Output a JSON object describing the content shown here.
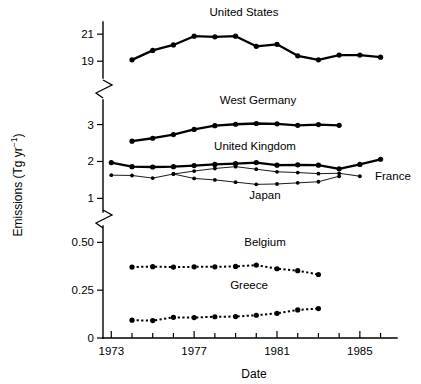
{
  "chart_data": {
    "type": "line",
    "title": "",
    "xlabel": "Date",
    "ylabel": "Emissions (Tg yr−1)",
    "ylabel_plain": "Emissions (Tg yr-1)",
    "x": [
      1974,
      1975,
      1976,
      1977,
      1978,
      1979,
      1980,
      1981,
      1982,
      1983,
      1984,
      1985,
      1986
    ],
    "xlim": [
      1972.6,
      1986.6
    ],
    "xticks_major": [
      1973,
      1977,
      1981,
      1985
    ],
    "xtick_labels": [
      "1973",
      "1977",
      "1981",
      "1985"
    ],
    "xticks_minor": [
      1974,
      1975,
      1976,
      1978,
      1979,
      1980,
      1982,
      1983,
      1984,
      1986
    ],
    "grid": false,
    "legend": "inline-labels",
    "broken_axis": true,
    "panels": [
      {
        "name": "top-panel",
        "ylim": [
          18.2,
          21.9
        ],
        "yticks": [
          19,
          21
        ],
        "ytick_labels": [
          "19",
          "21"
        ]
      },
      {
        "name": "middle-panel",
        "ylim": [
          0.82,
          3.45
        ],
        "yticks": [
          1,
          2,
          3
        ],
        "ytick_labels": [
          "1",
          "2",
          "3"
        ]
      },
      {
        "name": "bottom-panel",
        "ylim": [
          0,
          0.575
        ],
        "yticks": [
          0,
          0.25,
          0.5
        ],
        "ytick_labels": [
          "0",
          "0.25",
          "0.50"
        ]
      }
    ],
    "series": [
      {
        "name": "United States",
        "panel": "top-panel",
        "style": "solid-thick",
        "marker": "filled-circle-large",
        "label_x": 1979.0,
        "x": [
          1974,
          1975,
          1976,
          1977,
          1978,
          1979,
          1980,
          1981,
          1982,
          1983,
          1984,
          1985,
          1986
        ],
        "values": [
          19.1,
          19.8,
          20.2,
          20.85,
          20.8,
          20.85,
          20.1,
          20.25,
          19.4,
          19.1,
          19.45,
          19.45,
          19.3
        ]
      },
      {
        "name": "West Germany",
        "panel": "middle-panel",
        "style": "solid-thick",
        "marker": "filled-circle-large",
        "label_x": 1978.7,
        "x": [
          1974,
          1975,
          1976,
          1977,
          1978,
          1979,
          1980,
          1981,
          1982,
          1983,
          1984
        ],
        "values": [
          2.55,
          2.63,
          2.73,
          2.87,
          2.97,
          3.01,
          3.03,
          3.02,
          2.98,
          3.0,
          2.98
        ]
      },
      {
        "name": "United Kingdom",
        "panel": "middle-panel",
        "style": "solid-thick",
        "marker": "filled-circle-large",
        "label_x": 1979.1,
        "x": [
          1973,
          1974,
          1975,
          1976,
          1977,
          1978,
          1979,
          1980,
          1981,
          1982,
          1983,
          1984,
          1985,
          1986
        ],
        "values": [
          1.97,
          1.86,
          1.85,
          1.86,
          1.89,
          1.92,
          1.94,
          1.97,
          1.9,
          1.91,
          1.9,
          1.8,
          1.92,
          2.06
        ]
      },
      {
        "name": "France",
        "panel": "middle-panel",
        "style": "solid-thin",
        "marker": "filled-circle-small",
        "label_x": 1986.7,
        "x": [
          1973,
          1974,
          1975,
          1976,
          1977,
          1978,
          1979,
          1980,
          1981,
          1982,
          1983,
          1984,
          1985
        ],
        "values": [
          1.63,
          1.62,
          1.55,
          1.66,
          1.74,
          1.81,
          1.86,
          1.79,
          1.72,
          1.7,
          1.67,
          1.68,
          1.6
        ]
      },
      {
        "name": "Japan",
        "panel": "middle-panel",
        "style": "solid-thin",
        "marker": "filled-circle-small",
        "label_x": 1979.6,
        "x": [
          1976,
          1977,
          1978,
          1979,
          1980,
          1981,
          1982,
          1983,
          1984
        ],
        "values": [
          1.66,
          1.54,
          1.5,
          1.44,
          1.38,
          1.39,
          1.42,
          1.45,
          1.6
        ]
      },
      {
        "name": "Belgium",
        "panel": "bottom-panel",
        "style": "dashed",
        "marker": "filled-circle-large",
        "label_x": 1979.3,
        "x": [
          1974,
          1975,
          1976,
          1977,
          1978,
          1979,
          1980,
          1981,
          1982,
          1983
        ],
        "values": [
          0.371,
          0.373,
          0.371,
          0.372,
          0.372,
          0.374,
          0.381,
          0.362,
          0.352,
          0.332
        ]
      },
      {
        "name": "Greece",
        "panel": "bottom-panel",
        "style": "dashed",
        "marker": "filled-circle-large",
        "label_x": 1978.7,
        "x": [
          1974,
          1975,
          1976,
          1977,
          1978,
          1979,
          1980,
          1981,
          1982,
          1983
        ],
        "values": [
          0.093,
          0.091,
          0.108,
          0.107,
          0.111,
          0.112,
          0.119,
          0.129,
          0.147,
          0.154
        ]
      }
    ],
    "annotations": [
      {
        "text": "United States",
        "for": "United States"
      },
      {
        "text": "West Germany",
        "for": "West Germany"
      },
      {
        "text": "United Kingdom",
        "for": "United Kingdom"
      },
      {
        "text": "France",
        "for": "France"
      },
      {
        "text": "Japan",
        "for": "Japan"
      },
      {
        "text": "Belgium",
        "for": "Belgium"
      },
      {
        "text": "Greece",
        "for": "Greece"
      }
    ],
    "colors": {
      "foreground": "#000000",
      "background": "#ffffff"
    }
  }
}
